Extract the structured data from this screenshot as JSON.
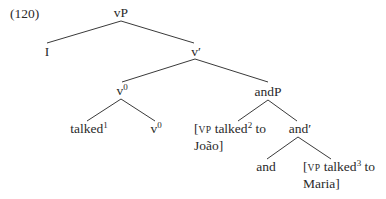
{
  "example_number": "(120)",
  "tree": {
    "root": {
      "label": "vP"
    },
    "I": {
      "label": "I"
    },
    "v_bar": {
      "label": "v′"
    },
    "v0_upper": {
      "base": "v",
      "sup": "0"
    },
    "andP": {
      "label": "andP"
    },
    "talked1": {
      "base": "talked",
      "sup": "1"
    },
    "v0_lower": {
      "base": "v",
      "sup": "0"
    },
    "vp_joao": {
      "open": "[",
      "cat": "VP",
      "base": " talked",
      "sup": "2",
      "rest": " to",
      "line2": "João]"
    },
    "and_bar": {
      "label": "and′"
    },
    "and_head": {
      "label": "and"
    },
    "vp_maria": {
      "open": "[",
      "cat": "VP",
      "base": " talked",
      "sup": "3",
      "rest": " to",
      "line2": "Maria]"
    }
  },
  "edges": [
    {
      "from": "vP",
      "to": "I"
    },
    {
      "from": "vP",
      "to": "v'"
    },
    {
      "from": "v'",
      "to": "v0"
    },
    {
      "from": "v'",
      "to": "andP"
    },
    {
      "from": "v0",
      "to": "talked1"
    },
    {
      "from": "v0",
      "to": "v0"
    },
    {
      "from": "andP",
      "to": "[VP talked2 to Joao]"
    },
    {
      "from": "andP",
      "to": "and'"
    },
    {
      "from": "and'",
      "to": "and"
    },
    {
      "from": "and'",
      "to": "[VP talked3 to Maria]"
    }
  ]
}
